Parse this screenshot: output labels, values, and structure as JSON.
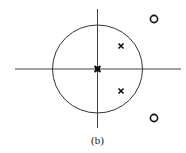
{
  "figure": {
    "caption": "(b)",
    "type": "pole-zero plot",
    "unit_circle": {
      "cx": 97.5,
      "cy": 69,
      "r": 44.5,
      "stroke": "#333333"
    },
    "axes": {
      "real": {
        "x1": 15,
        "x2": 181,
        "y": 69
      },
      "imag": {
        "x": 97.5,
        "y1": 9,
        "y2": 128
      },
      "stroke": "#444444"
    },
    "poles": [
      {
        "label": "pole-origin",
        "x": 97.5,
        "y": 69
      },
      {
        "label": "pole-upper",
        "x": 121,
        "y": 46
      },
      {
        "label": "pole-lower",
        "x": 121,
        "y": 91
      }
    ],
    "zeros": [
      {
        "label": "zero-upper",
        "x": 154,
        "y": 19
      },
      {
        "label": "zero-lower",
        "x": 154,
        "y": 118
      }
    ]
  }
}
